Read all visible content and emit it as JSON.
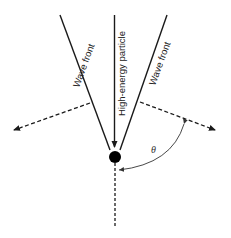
{
  "diagram": {
    "title": "",
    "labels": {
      "left_wave_front": "Wave front",
      "particle": "High-energy particle",
      "right_wave_front": "Wave front",
      "angle": "θ"
    },
    "colors": {
      "line": "#1a1a1a",
      "particle": "#000000",
      "background": "#ffffff"
    }
  }
}
